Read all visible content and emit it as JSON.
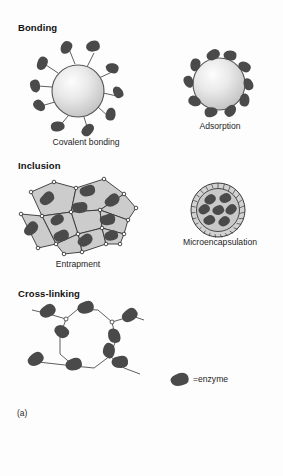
{
  "figure": {
    "panel_label": "(a)",
    "background_color": "#fdfdfd",
    "enzyme_color": "#4a4a4a",
    "support_color": "#c9c9c9",
    "line_color": "#3a3a3a"
  },
  "sections": [
    {
      "heading": "Bonding",
      "items": [
        {
          "caption": "Covalent bonding",
          "icon": "bead-with-linked-enzymes-icon",
          "enzyme_count": 9
        },
        {
          "caption": "Adsorption",
          "icon": "bead-with-surface-enzymes-icon",
          "enzyme_count": 10
        }
      ]
    },
    {
      "heading": "Inclusion",
      "items": [
        {
          "caption": "Entrapment",
          "icon": "polygonal-matrix-icon",
          "enzyme_count": 10
        },
        {
          "caption": "Microencapsulation",
          "icon": "microcapsule-icon",
          "enzyme_count": 7
        }
      ]
    },
    {
      "heading": "Cross-linking",
      "items": [
        {
          "caption": "",
          "icon": "crosslinked-network-icon",
          "enzyme_count": 9
        }
      ]
    }
  ],
  "legend": {
    "symbol": "enzyme-glyph-icon",
    "label": "=enzyme"
  }
}
